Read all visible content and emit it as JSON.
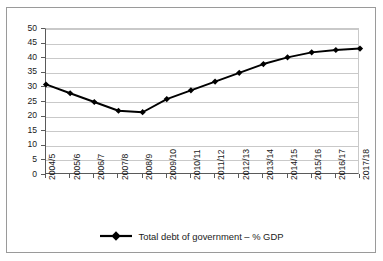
{
  "chart_data": {
    "type": "line",
    "title": "",
    "xlabel": "",
    "ylabel": "",
    "categories": [
      "2004/5",
      "2005/6",
      "2006/7",
      "2007/8",
      "2008/9",
      "2009/10",
      "2010/11",
      "2011/12",
      "2012/13",
      "2013/14",
      "2014/15",
      "2015/16",
      "2016/17",
      "2017/18"
    ],
    "series": [
      {
        "name": "Total debt of government – % GDP",
        "values": [
          31,
          28,
          25,
          22,
          21.5,
          26,
          29,
          32,
          35,
          38,
          40.3,
          42,
          42.8,
          43.3
        ]
      }
    ],
    "ylim": [
      0,
      50
    ],
    "yticks": [
      0,
      5,
      10,
      15,
      20,
      25,
      30,
      35,
      40,
      45,
      50
    ],
    "ytick_labels": [
      "0",
      "5",
      "10",
      "15",
      "20",
      "25",
      "30",
      "35",
      "40",
      "45",
      "50"
    ],
    "grid": true,
    "legend_position": "bottom",
    "marker": "diamond",
    "line_color": "#000000",
    "grid_color": "#c9c9c9",
    "axis_color": "#5a5a5a",
    "border_color": "#9a9a9a"
  },
  "legend": {
    "entries": [
      {
        "label": "Total debt of government – % GDP",
        "marker": "diamond-line-marker"
      }
    ]
  }
}
